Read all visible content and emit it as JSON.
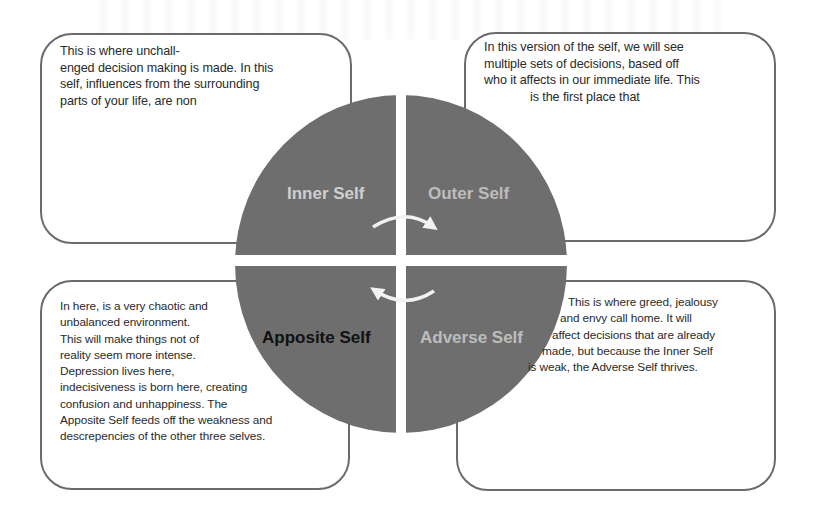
{
  "diagram": {
    "type": "four-quadrant-circle",
    "colors": {
      "circle_fill": "#6e6e6e",
      "box_border": "#6b6b6b",
      "label_light": "#cfcfcf",
      "label_dark": "#111111",
      "arrow": "#f2f2f2",
      "text": "#2a2a2a"
    },
    "quadrants": [
      {
        "id": "inner",
        "label": "Inner Self",
        "position": "top-left",
        "description_lines": [
          "This is where unchall-",
          "enged decision making is made. In this",
          "self, influences from the surrounding",
          "parts of your life, are non"
        ]
      },
      {
        "id": "outer",
        "label": "Outer Self",
        "position": "top-right",
        "description_lines": [
          "In this version of the self, we will see",
          "multiple sets of decisions, based off",
          "who it affects in our immediate life. This",
          "is the first place that"
        ]
      },
      {
        "id": "apposite",
        "label": "Apposite Self",
        "position": "bottom-left",
        "description_lines": [
          "In here, is a very chaotic and",
          "unbalanced environment.",
          "This will make things not of",
          "reality seem more intense.",
          "Depression lives here,",
          "indecisiveness is born here, creating",
          "confusion and unhappiness. The",
          "Apposite Self feeds off the weakness and",
          "descrepencies of the other three selves."
        ]
      },
      {
        "id": "adverse",
        "label": "Adverse Self",
        "position": "bottom-right",
        "description_lines": [
          "This is where greed, jealousy",
          "and envy call home. It will",
          "affect decisions that are already",
          "made, but because the Inner Self",
          "is weak, the Adverse Self thrives."
        ]
      }
    ],
    "arrows": [
      {
        "from": "inner",
        "to": "outer",
        "direction": "clockwise"
      },
      {
        "from": "adverse",
        "to": "apposite",
        "direction": "clockwise"
      }
    ]
  }
}
